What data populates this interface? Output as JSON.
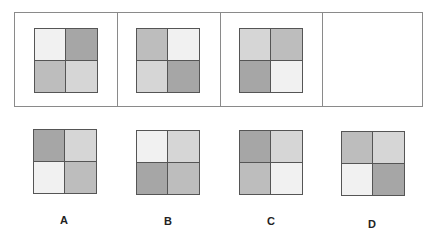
{
  "shades": {
    "lightest": "#f1f1f1",
    "light": "#d6d6d6",
    "medium": "#bdbdbd",
    "dark": "#a6a6a6"
  },
  "sequence": [
    {
      "cells": [
        "lightest",
        "dark",
        "medium",
        "light"
      ]
    },
    {
      "cells": [
        "medium",
        "lightest",
        "light",
        "dark"
      ]
    },
    {
      "cells": [
        "light",
        "medium",
        "dark",
        "lightest"
      ]
    },
    {
      "cells": []
    }
  ],
  "options": [
    {
      "label": "A",
      "cells": [
        "dark",
        "light",
        "lightest",
        "medium"
      ]
    },
    {
      "label": "B",
      "cells": [
        "lightest",
        "light",
        "dark",
        "medium"
      ]
    },
    {
      "label": "C",
      "cells": [
        "dark",
        "light",
        "medium",
        "lightest"
      ]
    },
    {
      "label": "D",
      "cells": [
        "medium",
        "light",
        "lightest",
        "dark"
      ]
    }
  ]
}
